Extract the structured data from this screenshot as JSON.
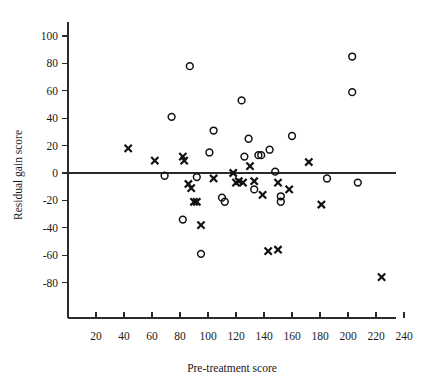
{
  "chart_data": {
    "type": "scatter",
    "title": "",
    "xlabel": "Pre-treatment score",
    "ylabel": "Residual gain score",
    "xlim": [
      0,
      250
    ],
    "ylim": [
      -95,
      115
    ],
    "xticks": [
      20,
      40,
      60,
      80,
      100,
      120,
      140,
      160,
      180,
      200,
      220,
      240
    ],
    "yticks": [
      100,
      80,
      60,
      40,
      20,
      0,
      -20,
      -40,
      -60,
      -80
    ],
    "grid": false,
    "legend": null,
    "annotations": [
      "horizontal reference line at y = 0"
    ],
    "series": [
      {
        "name": "circle-group",
        "marker": "circle",
        "points": [
          [
            87,
            78
          ],
          [
            74,
            41
          ],
          [
            69,
            -2
          ],
          [
            92,
            -3
          ],
          [
            82,
            -34
          ],
          [
            95,
            -59
          ],
          [
            104,
            31
          ],
          [
            101,
            15
          ],
          [
            110,
            -18
          ],
          [
            112,
            -21
          ],
          [
            124,
            53
          ],
          [
            129,
            25
          ],
          [
            126,
            12
          ],
          [
            136,
            13
          ],
          [
            133,
            -12
          ],
          [
            138,
            13
          ],
          [
            144,
            17
          ],
          [
            148,
            1
          ],
          [
            152,
            -17
          ],
          [
            152,
            -21
          ],
          [
            160,
            27
          ],
          [
            185,
            -4
          ],
          [
            203,
            85
          ],
          [
            203,
            59
          ],
          [
            207,
            -7
          ]
        ]
      },
      {
        "name": "cross-group",
        "marker": "cross",
        "points": [
          [
            43,
            18
          ],
          [
            62,
            9
          ],
          [
            82,
            12
          ],
          [
            83,
            9
          ],
          [
            86,
            -8
          ],
          [
            88,
            -11
          ],
          [
            90,
            -21
          ],
          [
            92,
            -21
          ],
          [
            95,
            -38
          ],
          [
            104,
            -4
          ],
          [
            118,
            0
          ],
          [
            120,
            -7
          ],
          [
            122,
            -6
          ],
          [
            125,
            -7
          ],
          [
            130,
            5
          ],
          [
            133,
            -6
          ],
          [
            139,
            -16
          ],
          [
            150,
            -7
          ],
          [
            143,
            -57
          ],
          [
            150,
            -56
          ],
          [
            158,
            -12
          ],
          [
            172,
            8
          ],
          [
            181,
            -23
          ],
          [
            224,
            -76
          ]
        ]
      }
    ]
  },
  "axes": {
    "x_axis_name": "pre-treatment-score-axis",
    "y_axis_name": "residual-gain-score-axis"
  }
}
